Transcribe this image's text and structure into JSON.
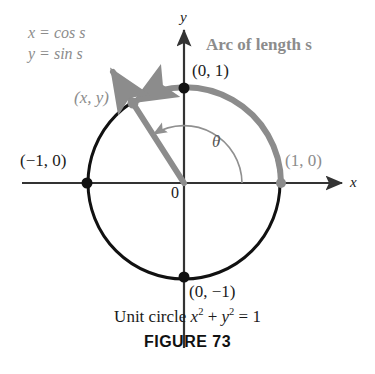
{
  "figure": {
    "caption_text_prefix": "Unit circle ",
    "caption_equation_x": "x",
    "caption_sup_2a": "2",
    "caption_plus": " + ",
    "caption_equation_y": "y",
    "caption_sup_2b": "2",
    "caption_equals": " = 1",
    "figure_number": "FIGURE 73"
  },
  "axes": {
    "x_label": "x",
    "y_label": "y",
    "origin_label": "0"
  },
  "parametric": {
    "line1": "x = cos s",
    "line2": "y = sin s"
  },
  "annotations": {
    "arc_label": "Arc of length s",
    "angle_symbol": "θ",
    "point_xy": "(x, y)"
  },
  "points": [
    {
      "name": "top",
      "label": "(0, 1)",
      "cx": 184,
      "cy": 88,
      "color": "#111111",
      "r": 5.5
    },
    {
      "name": "left",
      "label": "(−1, 0)",
      "cx": 87,
      "cy": 183,
      "color": "#111111",
      "r": 5.5
    },
    {
      "name": "right",
      "label": "(1, 0)",
      "cx": 281,
      "cy": 183,
      "color": "#8c8c8c",
      "r": 5.0
    },
    {
      "name": "bottom",
      "label": "(0, −1)",
      "cx": 184,
      "cy": 277,
      "color": "#111111",
      "r": 5.5
    },
    {
      "name": "terminal",
      "label": "(x, y)",
      "cx": 133,
      "cy": 103,
      "color": "#8c8c8c",
      "r": 5.5
    }
  ],
  "colors": {
    "circle_stroke": "#111111",
    "arc_stroke": "#8c8c8c",
    "ray_stroke": "#8c8c8c",
    "axis_stroke": "#333333",
    "angle_arc_stroke": "#909090",
    "text_black": "#1a1a1a",
    "text_gray": "#8c8c8c",
    "background": "#ffffff"
  },
  "geometry": {
    "center_x": 184,
    "center_y": 183,
    "radius": 96,
    "terminal_angle_deg": 122
  }
}
